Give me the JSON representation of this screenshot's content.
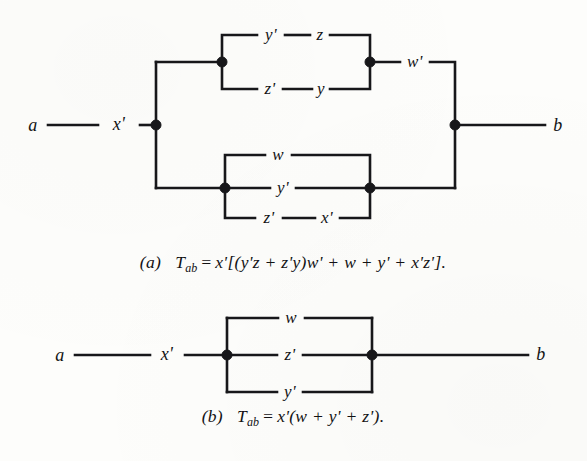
{
  "page": {
    "background_color": "#fdfdfb",
    "ink_color": "#17171a",
    "figure_count": 2
  },
  "figure_a": {
    "id": "figure-a",
    "terminal_left": "a",
    "terminal_right": "b",
    "series_label": "x'",
    "upper_bridge": {
      "top_branch": {
        "left": "y'",
        "right": "z"
      },
      "bottom_branch": {
        "left": "z'",
        "right": "y"
      },
      "series_after": "w'"
    },
    "lower_parallel": {
      "top_branch": "w",
      "middle_branch": "y'",
      "bottom_branch": {
        "left": "z'",
        "right": "x'"
      }
    },
    "caption": {
      "tag": "(a)",
      "lhs_symbol": "T",
      "lhs_subscript": "ab",
      "equals": "=",
      "rhs": "x'[(y'z + z'y)w' + w + y' + x'z'].",
      "full_text": "(a)  T_ab = x'[(y'z + z'y)w' + w + y' + x'z']."
    }
  },
  "figure_b": {
    "id": "figure-b",
    "terminal_left": "a",
    "terminal_right": "b",
    "series_label": "x'",
    "parallel": {
      "top_branch": "w",
      "middle_branch": "z'",
      "bottom_branch": "y'"
    },
    "caption": {
      "tag": "(b)",
      "lhs_symbol": "T",
      "lhs_subscript": "ab",
      "equals": "=",
      "rhs": "x'(w + y' + z').",
      "full_text": "(b)  T_ab = x'(w + y' + z')."
    }
  }
}
